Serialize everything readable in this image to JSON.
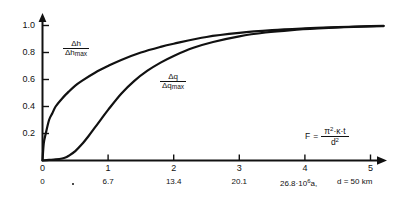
{
  "chart_data": {
    "type": "line",
    "title": "",
    "xlabel": "F = π²·κ·t / d²",
    "ylabel": "",
    "xlim": [
      0,
      5.3
    ],
    "ylim": [
      0,
      1.06
    ],
    "grid": false,
    "legend_position": "inline-curve-labels",
    "x_ticks": [
      "0",
      "1",
      "2",
      "3",
      "4",
      "5"
    ],
    "x_tick_values": [
      0,
      1,
      2,
      3,
      4,
      5
    ],
    "x_ticks_secondary": [
      "0",
      "6.7",
      "13.4",
      "20.1",
      "26.8"
    ],
    "x_tick_secondary_values": [
      0,
      1,
      2,
      3,
      4
    ],
    "y_ticks": [
      "0.2",
      "0.4",
      "0.6",
      "0.8",
      "1.0"
    ],
    "y_tick_values": [
      0.2,
      0.4,
      0.6,
      0.8,
      1.0
    ],
    "series": [
      {
        "name": "Δh / Δh_max",
        "label_numerator": "Δh",
        "label_denominator_base": "Δh",
        "label_denominator_sub": "max",
        "x": [
          0,
          0.02,
          0.05,
          0.1,
          0.15,
          0.2,
          0.3,
          0.4,
          0.5,
          0.6,
          0.8,
          1.0,
          1.2,
          1.5,
          1.8,
          2.0,
          2.5,
          3.0,
          3.5,
          4.0,
          4.5,
          5.0,
          5.2
        ],
        "values": [
          0,
          0.13,
          0.2,
          0.3,
          0.35,
          0.4,
          0.46,
          0.51,
          0.555,
          0.59,
          0.65,
          0.7,
          0.745,
          0.8,
          0.842,
          0.865,
          0.915,
          0.945,
          0.965,
          0.978,
          0.988,
          0.995,
          0.998
        ]
      },
      {
        "name": "Δq / Δq_max",
        "label_numerator": "Δq",
        "label_denominator_base": "Δq",
        "label_denominator_sub": "max",
        "x": [
          0,
          0.1,
          0.2,
          0.3,
          0.35,
          0.4,
          0.5,
          0.6,
          0.7,
          0.8,
          0.9,
          1.0,
          1.2,
          1.4,
          1.6,
          1.8,
          2.0,
          2.3,
          2.6,
          3.0,
          3.4,
          3.8,
          4.2,
          4.6,
          5.0,
          5.2
        ],
        "values": [
          0,
          0.004,
          0.008,
          0.015,
          0.022,
          0.035,
          0.07,
          0.12,
          0.18,
          0.245,
          0.31,
          0.375,
          0.495,
          0.59,
          0.665,
          0.725,
          0.775,
          0.835,
          0.878,
          0.92,
          0.948,
          0.966,
          0.978,
          0.987,
          0.994,
          0.996
        ]
      }
    ],
    "annotations": [
      {
        "name": "formula",
        "lhs": "F",
        "equals": "=",
        "numerator": "π²·κ·t",
        "denominator": "d²"
      },
      {
        "name": "time-axis-units",
        "text": "26.8·10⁶a,  d = 50 km"
      }
    ]
  },
  "axis": {
    "secondary_units_prefix": "26.8·10",
    "secondary_units_exp": "6",
    "secondary_units_suffix": "a,",
    "depth_note": "d = 50 km"
  },
  "formula": {
    "lhs": "F",
    "equals": "=",
    "numerator_pi": "π",
    "numerator_pi_exp": "2",
    "numerator_rest": "·κ·t",
    "denominator_base": "d",
    "denominator_exp": "2"
  },
  "curve_labels": {
    "h": {
      "num": "Δh",
      "den_base": "Δh",
      "den_sub": "max"
    },
    "q": {
      "num": "Δq",
      "den_base": "Δq",
      "den_sub": "max"
    }
  }
}
